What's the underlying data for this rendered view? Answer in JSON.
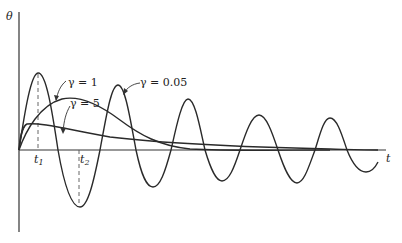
{
  "diagram": {
    "y_axis_label": "θ",
    "x_axis_label": "t",
    "time_markers": [
      {
        "label": "t",
        "sub": "1"
      },
      {
        "label": "t",
        "sub": "2"
      }
    ],
    "curves": [
      {
        "name": "gamma-0.05",
        "label": "γ = 0.05",
        "description": "lightly damped oscillation"
      },
      {
        "name": "gamma-1",
        "label": "γ = 1",
        "description": "critically damped response"
      },
      {
        "name": "gamma-5",
        "label": "γ = 5",
        "description": "overdamped response"
      }
    ],
    "line_color": "#2a2a2a"
  }
}
